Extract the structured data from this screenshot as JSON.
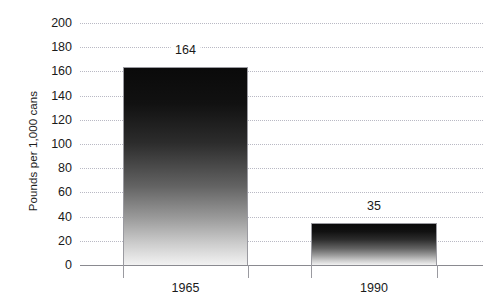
{
  "chart_data": {
    "type": "bar",
    "title": "",
    "subtitle": "",
    "xlabel": "",
    "ylabel": "Pounds per 1,000 cans",
    "categories": [
      "1965",
      "1990"
    ],
    "values": [
      164,
      35
    ],
    "data_labels": [
      "164",
      "35"
    ],
    "ylim": [
      0,
      200
    ],
    "ytick_labels": [
      "200",
      "180",
      "160",
      "140",
      "120",
      "100",
      "80",
      "60",
      "40",
      "20",
      "0"
    ],
    "ytick_values": [
      200,
      180,
      160,
      140,
      120,
      100,
      80,
      60,
      40,
      20,
      0
    ],
    "ytick_step": 20,
    "grid": true,
    "grid_style": "dotted",
    "grid_color": "#b9b9c4",
    "legend": false,
    "legend_position": "none",
    "series": [
      {
        "name": "Pounds per 1,000 cans",
        "values": [
          164,
          35
        ],
        "fill": "vertical-gradient-black-to-white",
        "fill_top_color": "#0a0a0a",
        "fill_bottom_color": "#f2f2f2",
        "border_color": "#9a9aa0"
      }
    ],
    "axis_color": "#8a8a90",
    "text_color": "#1a1a1a",
    "background_color": "#ffffff"
  }
}
